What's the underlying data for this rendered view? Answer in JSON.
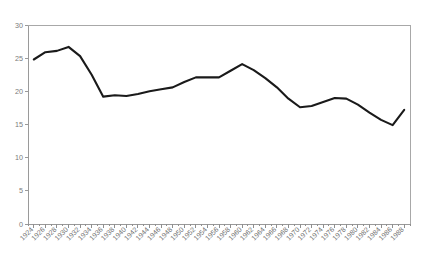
{
  "chart_data": {
    "type": "line",
    "title": "",
    "subtitle": "",
    "xlabel": "",
    "ylabel": "",
    "xlim": [
      1923,
      1989
    ],
    "ylim": [
      0,
      30
    ],
    "yticks": [
      0,
      5,
      10,
      15,
      20,
      25,
      30
    ],
    "ytick_labels": [
      "0",
      "5",
      "10",
      "15",
      "20",
      "25",
      "30"
    ],
    "grid": false,
    "legend": false,
    "legend_position": "none",
    "x_tick_rotation": "45",
    "categories": [
      "1924",
      "1926",
      "1928",
      "1930",
      "1932",
      "1934",
      "1936",
      "1938",
      "1940",
      "1942",
      "1944",
      "1946",
      "1948",
      "1950",
      "1952",
      "1954",
      "1956",
      "1958",
      "1960",
      "1962",
      "1964",
      "1966",
      "1968",
      "1970",
      "1972",
      "1974",
      "1976",
      "1978",
      "1980",
      "1982",
      "1984",
      "1986",
      "1988"
    ],
    "x": [
      1924,
      1926,
      1928,
      1930,
      1932,
      1934,
      1936,
      1938,
      1940,
      1942,
      1944,
      1946,
      1948,
      1950,
      1952,
      1954,
      1956,
      1958,
      1960,
      1962,
      1964,
      1966,
      1968,
      1970,
      1972,
      1974,
      1976,
      1978,
      1980,
      1982,
      1984,
      1986,
      1988
    ],
    "series": [
      {
        "name": "series-1",
        "color": "#1a1a1a",
        "values": [
          24.8,
          25.9,
          26.1,
          26.7,
          25.3,
          22.5,
          19.2,
          19.4,
          19.3,
          19.6,
          20.0,
          20.3,
          20.6,
          21.4,
          22.1,
          22.1,
          22.1,
          23.1,
          24.1,
          23.2,
          22.0,
          20.6,
          18.9,
          17.6,
          17.8,
          18.4,
          19.0,
          18.9,
          18.0,
          16.8,
          15.7,
          14.9,
          17.2
        ]
      }
    ],
    "values": [
      24.8,
      25.9,
      26.1,
      26.7,
      25.3,
      22.5,
      19.2,
      19.4,
      19.3,
      19.6,
      20.0,
      20.3,
      20.6,
      21.4,
      22.1,
      22.1,
      22.1,
      23.1,
      24.1,
      23.2,
      22.0,
      20.6,
      18.9,
      17.6,
      17.8,
      18.4,
      19.0,
      18.9,
      18.0,
      16.8,
      15.7,
      14.9,
      17.2
    ]
  },
  "plot_geometry": {
    "left": 28,
    "right": 410,
    "top": 25,
    "bottom": 224
  },
  "colors": {
    "series_line": "#1a1a1a",
    "axis": "#9a9a9a",
    "frame": "#a8a8a8",
    "tick_text": "#6f6f6f",
    "background": "#ffffff"
  }
}
